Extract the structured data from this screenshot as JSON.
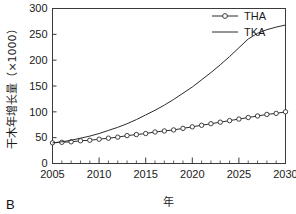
{
  "figure": {
    "panel_label": "B"
  },
  "legend": {
    "position": "top-right",
    "entries": [
      {
        "label": "THA",
        "marker": "open-circle",
        "line": "solid"
      },
      {
        "label": "TKA",
        "marker": "none",
        "line": "solid"
      }
    ]
  },
  "chart_data": {
    "type": "line",
    "title": "",
    "subtitle": "",
    "xlabel": "年",
    "ylabel": "干木年增长量（×1000）",
    "xlim": [
      2005,
      2030
    ],
    "ylim": [
      0,
      300
    ],
    "xticks": [
      2005,
      2010,
      2015,
      2020,
      2025,
      2030
    ],
    "xtick_labels": [
      "2005",
      "2010",
      "2015",
      "2020",
      "2025",
      "2030"
    ],
    "yticks": [
      0,
      50,
      100,
      150,
      200,
      250,
      300
    ],
    "ytick_labels": [
      "0",
      "50",
      "100",
      "150",
      "200",
      "250",
      "300"
    ],
    "minor_xtick_step": 1,
    "grid": false,
    "x": [
      2005,
      2006,
      2007,
      2008,
      2009,
      2010,
      2011,
      2012,
      2013,
      2014,
      2015,
      2016,
      2017,
      2018,
      2019,
      2020,
      2021,
      2022,
      2023,
      2024,
      2025,
      2026,
      2027,
      2028,
      2029,
      2030
    ],
    "series": [
      {
        "name": "THA",
        "marker": "open-circle",
        "values": [
          40,
          41,
          42,
          44,
          45,
          47,
          49,
          51,
          54,
          56,
          58,
          61,
          63,
          65,
          68,
          71,
          74,
          77,
          80,
          83,
          86,
          89,
          92,
          95,
          97,
          100
        ]
      },
      {
        "name": "TKA",
        "marker": "none",
        "values": [
          40,
          42,
          45,
          49,
          53,
          58,
          64,
          70,
          77,
          85,
          94,
          103,
          113,
          124,
          136,
          148,
          162,
          176,
          191,
          207,
          224,
          241,
          252,
          259,
          264,
          268
        ]
      }
    ],
    "annotations": []
  }
}
